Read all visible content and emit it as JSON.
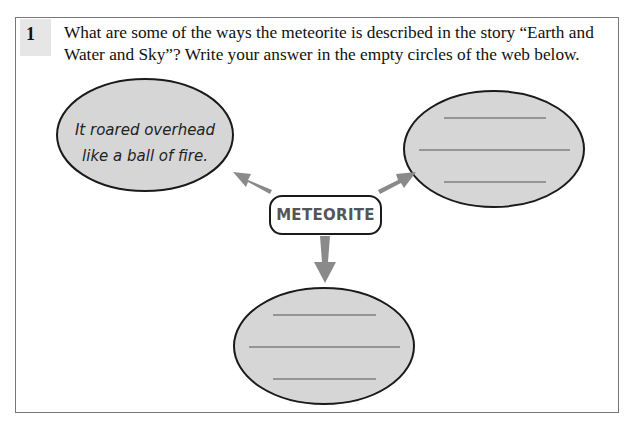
{
  "question": {
    "number": "1",
    "text": "What are some of the ways the meteorite is described in the story “Earth and Water and Sky”? Write your answer in the empty circles of the web below."
  },
  "web": {
    "center_label": "METEORITE",
    "nodes": [
      {
        "position": "top-left",
        "answer": "It roared overhead like a ball of fire.",
        "lines": 0
      },
      {
        "position": "top-right",
        "answer": "",
        "lines": 3
      },
      {
        "position": "bottom",
        "answer": "",
        "lines": 3
      }
    ]
  },
  "colors": {
    "ellipse_fill": "#d6d6d6",
    "ellipse_stroke": "#1a1a1a",
    "arrow": "#8a8a8a",
    "badge_bg": "#e6e6e6",
    "frame": "#777777"
  }
}
